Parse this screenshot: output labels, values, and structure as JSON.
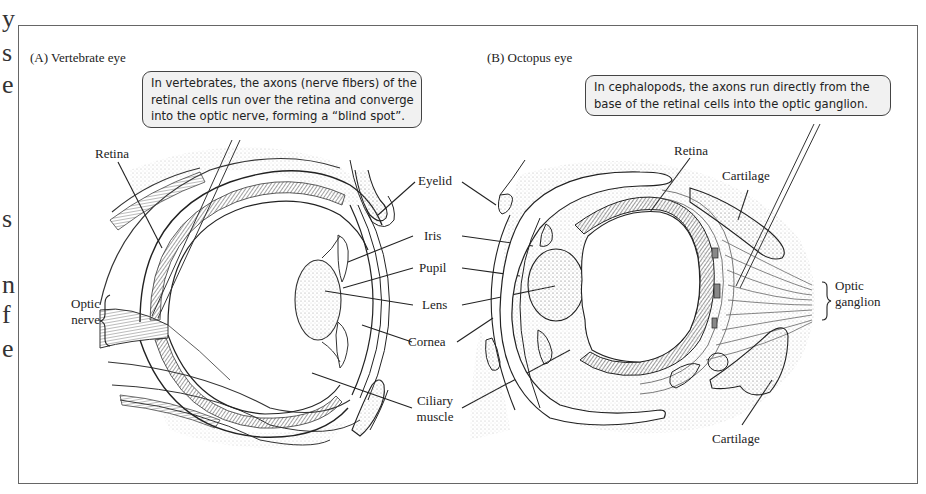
{
  "page_margin_text_fragments": [
    "y",
    "s",
    "e",
    "s",
    "n",
    "f",
    "e"
  ],
  "figure": {
    "panels": [
      {
        "id": "A",
        "title": "(A) Vertebrate eye",
        "callout": [
          "In vertebrates, the axons (nerve fibers) of the",
          "retinal cells run over the retina and converge",
          "into the optic nerve, forming a “blind spot”."
        ],
        "labels": {
          "retina": "Retina",
          "optic_nerve_line1": "Optic",
          "optic_nerve_line2": "nerve"
        }
      },
      {
        "id": "B",
        "title": "(B) Octopus eye",
        "callout": [
          "In cephalopods, the axons run directly from the",
          "base of the retinal cells into the optic ganglion."
        ],
        "labels": {
          "retina": "Retina",
          "cartilage_top": "Cartilage",
          "optic_ganglion_line1": "Optic",
          "optic_ganglion_line2": "ganglion",
          "cartilage_bottom": "Cartilage"
        }
      }
    ],
    "shared_labels": {
      "eyelid": "Eyelid",
      "iris": "Iris",
      "pupil": "Pupil",
      "lens": "Lens",
      "cornea": "Cornea",
      "ciliary_line1": "Ciliary",
      "ciliary_line2": "muscle"
    },
    "colors": {
      "frame": "#666666",
      "callout_fill": "#f1f1f1",
      "stipple": "#bdbdbd",
      "ink": "#222222"
    }
  }
}
